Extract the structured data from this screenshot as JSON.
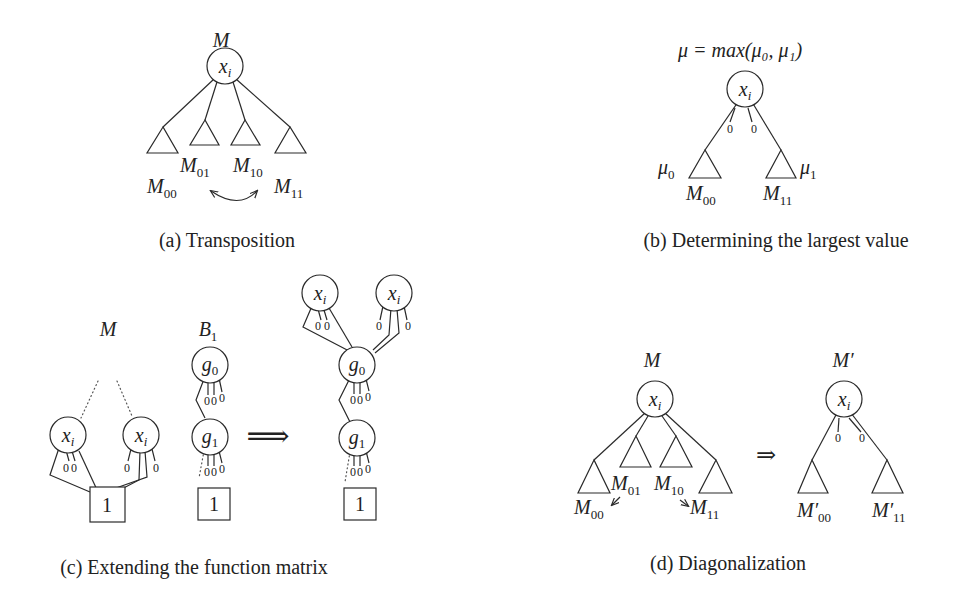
{
  "figures": {
    "a": {
      "caption": "(a) Transposition",
      "root_label": "M",
      "node": "x",
      "node_sub": "i",
      "leaves": [
        {
          "base": "M",
          "sub": "00"
        },
        {
          "base": "M",
          "sub": "01"
        },
        {
          "base": "M",
          "sub": "10"
        },
        {
          "base": "M",
          "sub": "11"
        }
      ]
    },
    "b": {
      "caption": "(b) Determining the largest value",
      "formula": "μ = max(μ₀, μ₁)",
      "node": "x",
      "node_sub": "i",
      "edge_marks": [
        "0",
        "0"
      ],
      "leaves": [
        {
          "base": "M",
          "sub": "00",
          "weight": "μ",
          "weight_sub": "0"
        },
        {
          "base": "M",
          "sub": "11",
          "weight": "μ",
          "weight_sub": "1"
        }
      ]
    },
    "c": {
      "caption": "(c) Extending the function matrix",
      "left_label": "M",
      "middle_label": "B",
      "middle_label_sub": "1",
      "nodes": {
        "x": "x",
        "x_sub": "i",
        "g0": "g",
        "g0_sub": "0",
        "g1": "g",
        "g1_sub": "1"
      },
      "terminal": "1",
      "arrow": "⟹",
      "edge_mark": "0"
    },
    "d": {
      "caption": "(d) Diagonalization",
      "left_label": "M",
      "right_label": "M′",
      "node": "x",
      "node_sub": "i",
      "arrow": "⇒",
      "left_leaves": [
        {
          "base": "M",
          "sub": "00"
        },
        {
          "base": "M",
          "sub": "01"
        },
        {
          "base": "M",
          "sub": "10"
        },
        {
          "base": "M",
          "sub": "11"
        }
      ],
      "right_leaves": [
        {
          "base": "M′",
          "sub": "00"
        },
        {
          "base": "M′",
          "sub": "11"
        }
      ],
      "edge_marks": [
        "0",
        "0"
      ]
    }
  }
}
